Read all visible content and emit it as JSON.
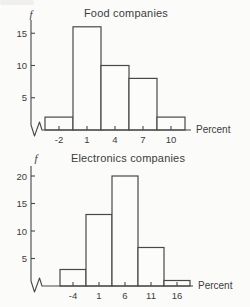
{
  "page": {
    "background": "#fbfbfa",
    "ink_color": "#3c3c3c",
    "line_color": "#484848"
  },
  "chart_data": [
    {
      "type": "bar",
      "subtype": "histogram",
      "title": "Food companies",
      "ylabel": "f",
      "xlabel": "Percent",
      "bin_centers": [
        -2,
        1,
        4,
        7,
        10
      ],
      "bin_width": 3,
      "values": [
        2,
        16,
        10,
        8,
        2
      ],
      "yticks": [
        5,
        10,
        15
      ],
      "ylim": [
        0,
        17
      ],
      "xtick_labels": [
        "-2",
        "1",
        "4",
        "7",
        "10"
      ],
      "axis_break_at_origin": true,
      "grid": false,
      "legend": "none",
      "bar_fill": "#fcfcfb"
    },
    {
      "type": "bar",
      "subtype": "histogram",
      "title": "Electronics companies",
      "ylabel": "f",
      "xlabel": "Percent",
      "bin_centers": [
        -4,
        1,
        6,
        11,
        16
      ],
      "bin_width": 5,
      "values": [
        3,
        13,
        20,
        7,
        1
      ],
      "yticks": [
        5,
        10,
        15,
        20
      ],
      "ylim": [
        0,
        21
      ],
      "xtick_labels": [
        "-4",
        "1",
        "6",
        "11",
        "16"
      ],
      "axis_break_at_origin": true,
      "grid": false,
      "legend": "none",
      "bar_fill": "#fcfcfb"
    }
  ]
}
